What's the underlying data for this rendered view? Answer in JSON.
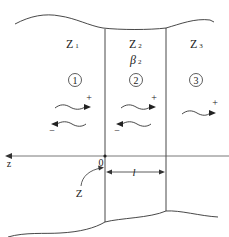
{
  "diagram": {
    "regions": [
      {
        "id": "1",
        "impedance_symbol": "Z",
        "impedance_subscript": "1",
        "circled_number": "1"
      },
      {
        "id": "2",
        "impedance_symbol": "Z",
        "impedance_subscript": "2",
        "propagation_symbol": "β",
        "propagation_subscript": "2",
        "circled_number": "2"
      },
      {
        "id": "3",
        "impedance_symbol": "Z",
        "impedance_subscript": "3",
        "circled_number": "3"
      }
    ],
    "wave_signs": {
      "forward": "+",
      "backward": "−"
    },
    "axis": {
      "label": "z",
      "origin_label": "0"
    },
    "length_label": "l",
    "interface_label": "Z",
    "colors": {
      "line": "#333333",
      "text": "#222222",
      "background": "#ffffff"
    }
  }
}
